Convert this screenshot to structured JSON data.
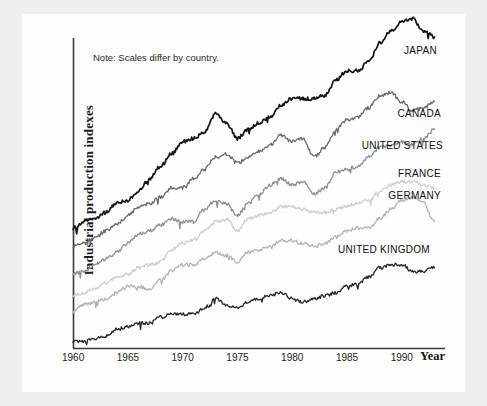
{
  "figure": {
    "note": "Note: Scales differ by country.",
    "y_axis_label": "Industrial  production  indexes",
    "x_axis_label": "Year"
  },
  "axis": {
    "x_ticks": [
      "1960",
      "1965",
      "1970",
      "1975",
      "1980",
      "1985",
      "1990"
    ],
    "x_tick_values": [
      1960,
      1965,
      1970,
      1975,
      1980,
      1985,
      1990
    ]
  },
  "colors": {
    "japan": "#151515",
    "canada": "#6a6a6a",
    "united_states": "#8f8f8f",
    "france": "#cfcfcf",
    "germany": "#b4b4b4",
    "united_kingdom": "#262626",
    "axis": "#3a3a3a",
    "plate": "#fdfdfd",
    "page": "#efefef"
  },
  "chart_data": {
    "type": "line",
    "title": "",
    "subtitle": "",
    "xlabel": "Year",
    "ylabel": "Industrial production indexes",
    "note": "Note: Scales differ by country.",
    "grid": false,
    "legend_position": "right-inline",
    "xlim": [
      1960,
      1993.5
    ],
    "ylim": [
      0,
      100
    ],
    "y_axis_ticks_shown": false,
    "x": [
      1960,
      1961,
      1962,
      1963,
      1964,
      1965,
      1966,
      1967,
      1968,
      1969,
      1970,
      1971,
      1972,
      1973,
      1974,
      1975,
      1976,
      1977,
      1978,
      1979,
      1980,
      1981,
      1982,
      1983,
      1984,
      1985,
      1986,
      1987,
      1988,
      1989,
      1990,
      1991,
      1992,
      1993
    ],
    "series": [
      {
        "name": "JAPAN",
        "color": "#151515",
        "label_x": 437,
        "label_y": 45,
        "values": [
          39,
          41,
          42,
          44,
          47,
          48,
          51,
          55,
          59,
          63,
          67,
          68,
          70,
          76,
          73,
          68,
          71,
          73,
          75,
          79,
          81,
          81,
          81,
          82,
          87,
          90,
          90,
          93,
          99,
          103,
          106,
          107,
          103,
          101
        ]
      },
      {
        "name": "CANADA",
        "color": "#6a6a6a",
        "label_x": 441,
        "label_y": 108,
        "values": [
          33,
          34,
          36,
          38,
          40,
          43,
          46,
          47,
          49,
          52,
          52,
          55,
          58,
          62,
          63,
          60,
          62,
          64,
          66,
          69,
          67,
          68,
          62,
          65,
          71,
          74,
          75,
          78,
          82,
          83,
          80,
          77,
          78,
          80
        ]
      },
      {
        "name": "UNITED STATES",
        "color": "#8f8f8f",
        "label_x": 443,
        "label_y": 140,
        "values": [
          24,
          25,
          27,
          29,
          31,
          34,
          37,
          38,
          40,
          42,
          41,
          41,
          45,
          48,
          47,
          43,
          47,
          50,
          53,
          55,
          53,
          54,
          50,
          52,
          57,
          58,
          59,
          62,
          65,
          66,
          67,
          66,
          68,
          71
        ]
      },
      {
        "name": "FRANCE",
        "color": "#cfcfcf",
        "label_x": 441,
        "label_y": 168,
        "values": [
          17,
          18,
          19,
          21,
          23,
          24,
          26,
          27,
          28,
          32,
          34,
          35,
          38,
          41,
          42,
          38,
          42,
          43,
          44,
          46,
          46,
          45,
          44,
          44,
          45,
          46,
          47,
          48,
          51,
          53,
          54,
          54,
          53,
          52
        ]
      },
      {
        "name": "GERMANY",
        "color": "#b4b4b4",
        "label_x": 441,
        "label_y": 190,
        "values": [
          12,
          14,
          15,
          16,
          18,
          20,
          20,
          19,
          22,
          25,
          27,
          27,
          29,
          31,
          30,
          28,
          31,
          32,
          33,
          35,
          35,
          34,
          33,
          34,
          36,
          38,
          39,
          39,
          42,
          45,
          48,
          49,
          47,
          41
        ]
      },
      {
        "name": "UNITED KINGDOM",
        "color": "#262626",
        "label_x": 430,
        "label_y": 244,
        "values": [
          2,
          2,
          3,
          4,
          6,
          7,
          8,
          8,
          10,
          11,
          11,
          11,
          13,
          16,
          14,
          13,
          15,
          16,
          17,
          18,
          16,
          15,
          16,
          17,
          18,
          20,
          21,
          23,
          26,
          27,
          27,
          25,
          25,
          26
        ]
      }
    ]
  }
}
